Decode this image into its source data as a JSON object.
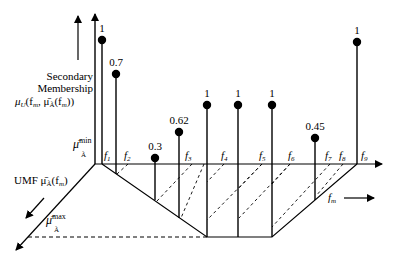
{
  "labels": {
    "secondary_line1": "Secondary",
    "secondary_line2": "Membership",
    "secondary_mu": "μ",
    "secondary_sub": "U",
    "secondary_args": "(f",
    "secondary_args_m": "m",
    "secondary_mid": ", μ̄",
    "secondary_A": "Ã",
    "secondary_end": "(f",
    "secondary_end_m": "m",
    "secondary_close": "))",
    "mu_min": "μ̄",
    "mu_min_sup": "min",
    "mu_min_sub": "Ã",
    "umf_text": "UMF μ̄",
    "umf_sub": "Ã",
    "umf_args": "(f",
    "umf_args_m": "m",
    "umf_close": ")",
    "mu_max": "μ̄",
    "mu_max_sup": "max",
    "mu_max_sub": "Ã",
    "fm_label": "f",
    "fm_sub": "m"
  },
  "f_ticks": [
    {
      "name": "f",
      "sub": "1"
    },
    {
      "name": "f",
      "sub": "2"
    },
    {
      "name": "f",
      "sub": "3"
    },
    {
      "name": "f",
      "sub": "4"
    },
    {
      "name": "f",
      "sub": "5"
    },
    {
      "name": "f",
      "sub": "6"
    },
    {
      "name": "f",
      "sub": "7"
    },
    {
      "name": "f",
      "sub": "8"
    },
    {
      "name": "f",
      "sub": "9"
    }
  ],
  "pins": [
    {
      "value": "1"
    },
    {
      "value": "0.7"
    },
    {
      "value": "0.3"
    },
    {
      "value": "0.62"
    },
    {
      "value": "1"
    },
    {
      "value": "1"
    },
    {
      "value": "1"
    },
    {
      "value": "0.45"
    },
    {
      "value": "1"
    }
  ]
}
